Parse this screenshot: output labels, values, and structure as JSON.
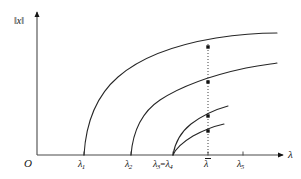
{
  "figure": {
    "kind": "bifurcation-diagram",
    "background": "#ffffff",
    "ink": "#141414"
  },
  "axes": {
    "y_label": "‖x‖",
    "x_label": "λ",
    "origin_label": "O",
    "x_axis": {
      "x_start": 37,
      "x_end": 283,
      "y": 155,
      "arrow": true
    },
    "y_axis": {
      "x": 37,
      "y_start": 155,
      "y_end": 12,
      "arrow": true
    }
  },
  "ticks": [
    {
      "name": "lambda-1",
      "base": "λ",
      "sub": "1",
      "x": 84,
      "label_x": 78,
      "label_y": 159
    },
    {
      "name": "lambda-2",
      "base": "λ",
      "sub": "2",
      "x": 131,
      "label_x": 125,
      "label_y": 159
    },
    {
      "name": "lambda-3-equals-lambda-4",
      "base": "λ",
      "sub": "3",
      "eq": "=",
      "base2": "λ",
      "sub2": "4",
      "x": 173,
      "label_x": 153,
      "label_y": 159
    },
    {
      "name": "lambda-bar",
      "base": "λ",
      "sub": "",
      "x": 208,
      "label_x": 204,
      "label_y": 159,
      "overbar": true
    },
    {
      "name": "lambda-5",
      "base": "λ",
      "sub": "5",
      "x": 243,
      "label_x": 237,
      "label_y": 159
    }
  ],
  "chart_data": {
    "type": "line",
    "title": "",
    "xlabel": "λ",
    "ylabel": "‖x‖",
    "grid": false,
    "legend": null,
    "xlim": [
      37,
      283
    ],
    "ylim": [
      155,
      12
    ],
    "branches": [
      {
        "name": "branch-lambda-1",
        "bifurcation_point": "λ1",
        "start": [
          84,
          155
        ],
        "end": [
          277,
          33
        ],
        "path": "M84,155 C86,122 96,96 118,77 C142,56 180,44 216,38 C242,34 264,33 277,33"
      },
      {
        "name": "branch-lambda-2",
        "bifurcation_point": "λ2",
        "start": [
          131,
          155
        ],
        "end": [
          277,
          63
        ],
        "path": "M131,155 C133,130 142,112 160,100 C183,85 218,74 246,68 C261,65 271,64 277,63"
      },
      {
        "name": "branch-lambda-3",
        "bifurcation_point": "λ3=λ4",
        "start": [
          173,
          155
        ],
        "end": [
          228,
          106
        ],
        "path": "M173,155 C175,142 181,132 191,124 C203,115 217,109 228,106"
      },
      {
        "name": "branch-lambda-4",
        "bifurcation_point": "λ3=λ4",
        "start": [
          173,
          155
        ],
        "end": [
          224,
          124
        ],
        "path": "M173,155 C176,148 183,142 193,136 C204,130 215,126 224,124"
      }
    ],
    "dotted_line": {
      "name": "lambda-bar-guideline",
      "x": 208,
      "y_top": 44,
      "y_bottom": 155,
      "style": "dotted"
    },
    "intersection_points": [
      {
        "name": "point-branch-1",
        "x": 208,
        "y": 47
      },
      {
        "name": "point-branch-2",
        "x": 208,
        "y": 82
      },
      {
        "name": "point-branch-3",
        "x": 208,
        "y": 116
      },
      {
        "name": "point-branch-4",
        "x": 208,
        "y": 131
      }
    ]
  }
}
